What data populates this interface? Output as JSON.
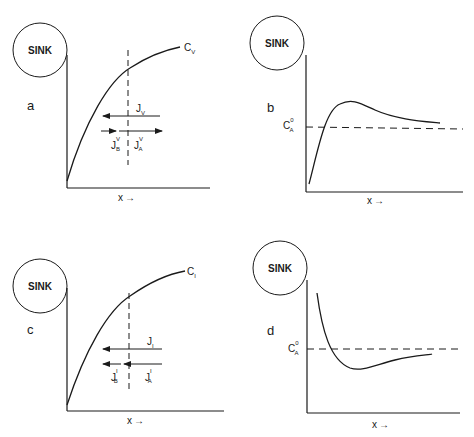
{
  "figure": {
    "panels": [
      {
        "id": "a",
        "panel_label": "a",
        "sink_label": "SINK",
        "curve_label": "C",
        "curve_label_sub": "V",
        "x_axis_label": "x",
        "flux_total": {
          "sym": "J",
          "sub": "V",
          "direction": "left"
        },
        "flux_B": {
          "sym": "J",
          "sup": "V",
          "sub": "B",
          "direction": "right"
        },
        "flux_A": {
          "sym": "J",
          "sup": "V",
          "sub": "A",
          "direction": "right"
        }
      },
      {
        "id": "b",
        "panel_label": "b",
        "sink_label": "SINK",
        "ref_label": "C",
        "ref_label_sup": "0",
        "ref_label_sub": "A",
        "x_axis_label": "x"
      },
      {
        "id": "c",
        "panel_label": "c",
        "sink_label": "SINK",
        "curve_label": "C",
        "curve_label_sub": "I",
        "x_axis_label": "x",
        "flux_total": {
          "sym": "J",
          "sub": "I",
          "direction": "left"
        },
        "flux_B": {
          "sym": "J",
          "sup": "I",
          "sub": "B",
          "direction": "left"
        },
        "flux_A": {
          "sym": "J",
          "sup": "I",
          "sub": "A",
          "direction": "left"
        }
      },
      {
        "id": "d",
        "panel_label": "d",
        "sink_label": "SINK",
        "ref_label": "C",
        "ref_label_sup": "0",
        "ref_label_sub": "A",
        "x_axis_label": "x"
      }
    ],
    "arrow_glyph": "→",
    "colors": {
      "ink": "#1a1a1a",
      "background": "#ffffff"
    }
  }
}
